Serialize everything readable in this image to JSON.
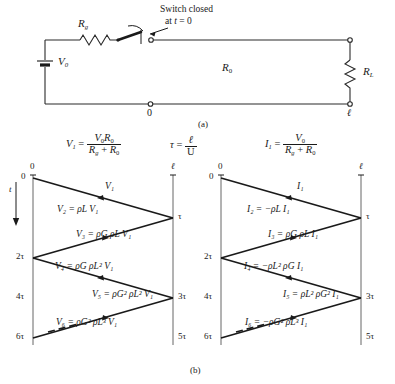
{
  "figure": {
    "panel_a_caption": "(a)",
    "panel_b_caption": "(b)"
  },
  "circuit": {
    "source_label": "V",
    "source_sub": "0",
    "rg_label": "R",
    "rg_sub": "g",
    "r0_label": "R",
    "r0_sub": "0",
    "rl_label": "R",
    "rl_sub": "L",
    "switch_note_line1": "Switch closed",
    "switch_note_line2_pre": "at ",
    "switch_note_line2_t": "t",
    "switch_note_line2_post": " = 0",
    "node_left": "0",
    "node_right": "ℓ"
  },
  "formulas": {
    "v1": {
      "lhs": "V",
      "lhs_sub": "1",
      "eq": "=",
      "num_a": "V",
      "num_a_sub": "0",
      "num_b": "R",
      "num_b_sub": "0",
      "den_a": "R",
      "den_a_sub": "g",
      "den_plus": "+",
      "den_b": "R",
      "den_b_sub": "0"
    },
    "tau": {
      "lhs": "τ",
      "eq": "=",
      "num": "ℓ",
      "den": "U"
    },
    "i1": {
      "lhs": "I",
      "lhs_sub": "1",
      "eq": "=",
      "num_a": "V",
      "num_a_sub": "0",
      "den_a": "R",
      "den_a_sub": "g",
      "den_plus": "+",
      "den_b": "R",
      "den_b_sub": "0"
    }
  },
  "lattice": {
    "time_axis_label": "t",
    "time_ticks": [
      "0",
      "2τ",
      "4τ",
      "6τ"
    ],
    "position_ticks": [
      "0",
      "ℓ"
    ],
    "right_time_ticks": [
      "τ",
      "3τ",
      "5τ"
    ],
    "voltage": {
      "title_var": "V",
      "waves": [
        {
          "name": "V1",
          "label_html": "V₁"
        },
        {
          "name": "V2",
          "label_html": "V₂ = ρL V₁"
        },
        {
          "name": "V3",
          "label_html": "V₃ = ρG ρL V₁"
        },
        {
          "name": "V4",
          "label_html": "V₄ = ρG ρL² V₁"
        },
        {
          "name": "V5",
          "label_html": "V₅ = ρG² ρL² V₁"
        },
        {
          "name": "V6",
          "label_html": "V₆ = ρG² ρL³ V₁"
        }
      ]
    },
    "current": {
      "title_var": "I",
      "waves": [
        {
          "name": "I1",
          "label_html": "I₁"
        },
        {
          "name": "I2",
          "label_html": "I₂ = −ρL I₁"
        },
        {
          "name": "I3",
          "label_html": "I₃ = ρG ρL I₁"
        },
        {
          "name": "I4",
          "label_html": "I₄ = −ρL² ρG I₁"
        },
        {
          "name": "I5",
          "label_html": "I₅ = ρL² ρG² I₁"
        },
        {
          "name": "I6",
          "label_html": "I₆ = −ρG² ρL³ I₁"
        }
      ]
    }
  },
  "colors": {
    "ink": "#1a1a1a",
    "line": "#2a2a2a"
  }
}
